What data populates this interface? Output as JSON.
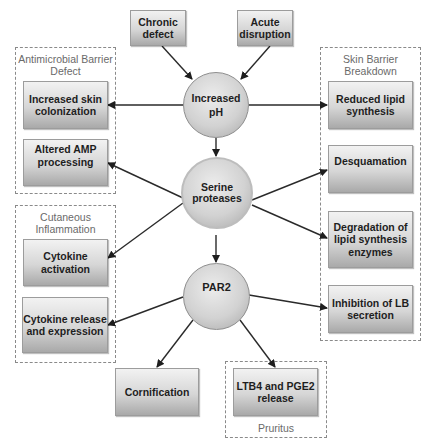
{
  "diagram": {
    "sources": {
      "chronic": "Chronic\ndefect",
      "acute": "Acute\ndisruption"
    },
    "hubs": {
      "ph": "Increased\npH",
      "serine": "Serine\nproteases",
      "par2": "PAR2"
    },
    "groups": {
      "antimicrobial": {
        "label": "Antimicrobial Barrier\nDefect",
        "items": [
          "Increased skin\ncolonization",
          "Altered AMP\nprocessing"
        ]
      },
      "cutaneous": {
        "label": "Cutaneous\nInflammation",
        "items": [
          "Cytokine\nactivation",
          "Cytokine release\nand expression"
        ]
      },
      "skin_barrier": {
        "label": "Skin Barrier\nBreakdown",
        "items": [
          "Reduced lipid\nsynthesis",
          "Desquamation",
          "Degradation of\nlipid synthesis\nenzymes",
          "Inhibition of LB\nsecretion"
        ]
      },
      "pruritus": {
        "label": "Pruritus",
        "items": [
          "LTB4 and PGE2\nrelease"
        ]
      }
    },
    "standalone": {
      "cornification": "Cornification"
    },
    "edges": [
      [
        "Chronic defect",
        "Increased pH"
      ],
      [
        "Acute disruption",
        "Increased pH"
      ],
      [
        "Increased pH",
        "Increased skin colonization"
      ],
      [
        "Increased pH",
        "Reduced lipid synthesis"
      ],
      [
        "Increased pH",
        "Serine proteases"
      ],
      [
        "Serine proteases",
        "Altered AMP processing"
      ],
      [
        "Serine proteases",
        "Cytokine activation"
      ],
      [
        "Serine proteases",
        "Desquamation"
      ],
      [
        "Serine proteases",
        "Degradation of lipid synthesis enzymes"
      ],
      [
        "Serine proteases",
        "PAR2"
      ],
      [
        "PAR2",
        "Cytokine release and expression"
      ],
      [
        "PAR2",
        "Inhibition of LB secretion"
      ],
      [
        "PAR2",
        "Cornification"
      ],
      [
        "PAR2",
        "LTB4 and PGE2 release"
      ]
    ]
  }
}
